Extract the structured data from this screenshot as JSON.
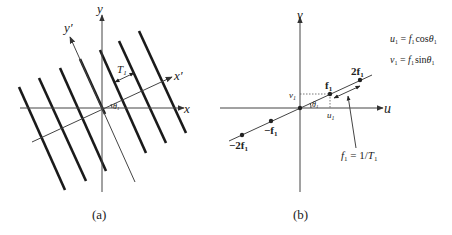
{
  "panel_a": {
    "caption": "(a)",
    "axis_x_label": "x",
    "axis_y_label": "y",
    "axis_xprime_label": "x′",
    "axis_yprime_label": "y′",
    "period_label": "T",
    "period_sub": "1",
    "angle_label": "θ",
    "angle_sub": "1",
    "grating_line_count": 7
  },
  "panel_b": {
    "caption": "(b)",
    "axis_u_label": "u",
    "axis_v_label": "v",
    "point_f1": "f",
    "point_f1_sub": "1",
    "point_2f1": "2f",
    "point_2f1_sub": "1",
    "point_neg_f1": "−f",
    "point_neg_f1_sub": "1",
    "point_neg_2f1": "−2f",
    "point_neg_2f1_sub": "1",
    "u1_label": "u",
    "u1_sub": "1",
    "v1_label": "v",
    "v1_sub": "1",
    "angle_label": "θ",
    "angle_sub": "1",
    "annotation": {
      "lhs": "f",
      "lhs_sub": "1",
      "rhs": " = 1/",
      "rhs_T": "T",
      "rhs_T_sub": "1"
    }
  },
  "equations": {
    "eq1": {
      "lhs": "u",
      "lhs_sub": "1",
      "eq": " = ",
      "f": "f",
      "f_sub": "1",
      "fn": "cos",
      "theta": "θ",
      "theta_sub": "1"
    },
    "eq2": {
      "lhs": "v",
      "lhs_sub": "1",
      "eq": " = ",
      "f": "f",
      "f_sub": "1",
      "fn": "sin",
      "theta": "θ",
      "theta_sub": "1"
    }
  }
}
